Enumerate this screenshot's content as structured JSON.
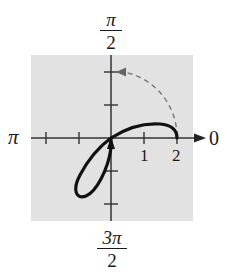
{
  "diagram": {
    "type": "polar-graph",
    "background_color": "#e2e2e2",
    "curve_color": "#111111",
    "dashed_arc_color": "#777777",
    "labels": {
      "top": {
        "numerator": "π",
        "denominator": "2"
      },
      "bottom": {
        "numerator": "3π",
        "denominator": "2"
      },
      "left": "π",
      "right": "0"
    },
    "radial_tick_labels": [
      "1",
      "2"
    ],
    "radial_ticks": [
      -2,
      -1,
      1,
      2
    ],
    "curve_description": "Solid curve starting at r=2 on the polar axis, arcing above the axis to the pole, then forming a loop in the third quadrant; arrow at the pole indicates direction",
    "dashed_arc_description": "Dashed quarter-circle of radius 2 from angle 0 to π/2 with arrowhead pointing toward π/2"
  }
}
